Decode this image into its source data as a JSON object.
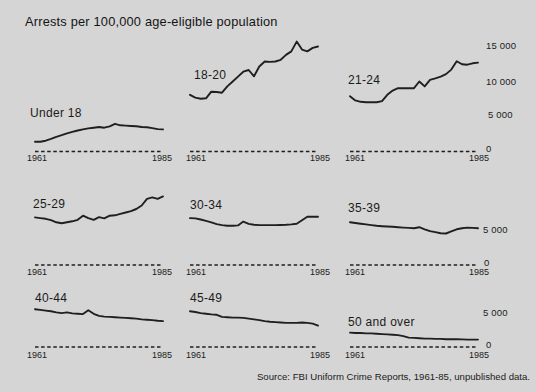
{
  "title": "Arrests per 100,000 age-eligible population",
  "source": "Source: FBI Uniform Crime Reports, 1961-85, unpublished data.",
  "colors": {
    "background": "#d5d5d5",
    "ink": "#1f1f1f"
  },
  "axis": {
    "x_start_label": "1961",
    "x_end_label": "1985",
    "row1_ticks": [
      "15 000",
      "10 000",
      "5 000",
      "0"
    ],
    "row23_ticks": [
      "5 000",
      "0"
    ]
  },
  "chart_data": {
    "type": "line",
    "title": "Arrests per 100,000 age-eligible population",
    "layout": "3x3 small multiples, shared x-axis 1961-1985, dashed zero baseline per panel, y ticks on right edge only (row 1: 0-15000; rows 2-3: 0-5000)",
    "xlabel": "",
    "ylabel": "Arrests per 100,000 age-eligible population",
    "x_range": [
      1961,
      1985
    ],
    "years": [
      1961,
      1962,
      1963,
      1964,
      1965,
      1966,
      1967,
      1968,
      1969,
      1970,
      1971,
      1972,
      1973,
      1974,
      1975,
      1976,
      1977,
      1978,
      1979,
      1980,
      1981,
      1982,
      1983,
      1984,
      1985
    ],
    "panels": [
      {
        "label": "Under 18",
        "ylim": [
          0,
          16000
        ],
        "values": [
          1400,
          1400,
          1550,
          1800,
          2100,
          2350,
          2600,
          2800,
          3000,
          3150,
          3300,
          3400,
          3500,
          3400,
          3600,
          3950,
          3750,
          3700,
          3650,
          3600,
          3500,
          3450,
          3350,
          3200,
          3150
        ]
      },
      {
        "label": "18-20",
        "ylim": [
          0,
          16000
        ],
        "values": [
          8100,
          7700,
          7550,
          7600,
          8550,
          8500,
          8400,
          9300,
          10000,
          10700,
          11400,
          11650,
          10750,
          12150,
          12850,
          12800,
          12850,
          13100,
          13800,
          14300,
          15700,
          14550,
          14300,
          14800,
          15000
        ]
      },
      {
        "label": "21-24",
        "ylim": [
          0,
          16000
        ],
        "values": [
          7900,
          7300,
          7100,
          7050,
          7050,
          7050,
          7200,
          8100,
          8700,
          9050,
          9050,
          9050,
          9050,
          10000,
          9300,
          10250,
          10450,
          10700,
          11050,
          11700,
          12900,
          12450,
          12400,
          12600,
          12700
        ]
      },
      {
        "label": "25-29",
        "ylim": [
          0,
          7000
        ],
        "values": [
          6800,
          6700,
          6600,
          6400,
          6100,
          5950,
          6100,
          6250,
          6450,
          7050,
          6700,
          6450,
          6850,
          6650,
          7050,
          7100,
          7300,
          7500,
          7700,
          8000,
          8500,
          9450,
          9650,
          9450,
          9800
        ]
      },
      {
        "label": "30-34",
        "ylim": [
          0,
          7000
        ],
        "values": [
          6700,
          6650,
          6500,
          6300,
          6100,
          5850,
          5700,
          5600,
          5600,
          5650,
          6200,
          5870,
          5750,
          5700,
          5700,
          5700,
          5700,
          5720,
          5750,
          5800,
          5900,
          6400,
          6900,
          6900,
          6900
        ]
      },
      {
        "label": "35-39",
        "ylim": [
          0,
          7000
        ],
        "values": [
          6100,
          6000,
          5900,
          5800,
          5700,
          5600,
          5550,
          5500,
          5450,
          5400,
          5350,
          5300,
          5250,
          5400,
          5100,
          4850,
          4700,
          4550,
          4500,
          4800,
          5100,
          5250,
          5350,
          5300,
          5250
        ]
      },
      {
        "label": "40-44",
        "ylim": [
          0,
          7000
        ],
        "values": [
          5400,
          5300,
          5200,
          5100,
          4950,
          4850,
          4950,
          4800,
          4750,
          4700,
          5250,
          4750,
          4450,
          4350,
          4300,
          4250,
          4200,
          4150,
          4100,
          4050,
          3950,
          3900,
          3850,
          3750,
          3700
        ]
      },
      {
        "label": "45-49",
        "ylim": [
          0,
          7000
        ],
        "values": [
          5100,
          5000,
          4850,
          4750,
          4650,
          4600,
          4300,
          4250,
          4200,
          4200,
          4150,
          4050,
          3950,
          3850,
          3700,
          3600,
          3550,
          3500,
          3450,
          3450,
          3450,
          3500,
          3450,
          3350,
          3050
        ]
      },
      {
        "label": "50 and over",
        "ylim": [
          0,
          7000
        ],
        "values": [
          2050,
          2000,
          2000,
          1950,
          1950,
          1900,
          1850,
          1800,
          1750,
          1700,
          1550,
          1350,
          1300,
          1250,
          1200,
          1200,
          1150,
          1150,
          1100,
          1100,
          1100,
          1080,
          1060,
          1050,
          1050
        ]
      }
    ]
  }
}
